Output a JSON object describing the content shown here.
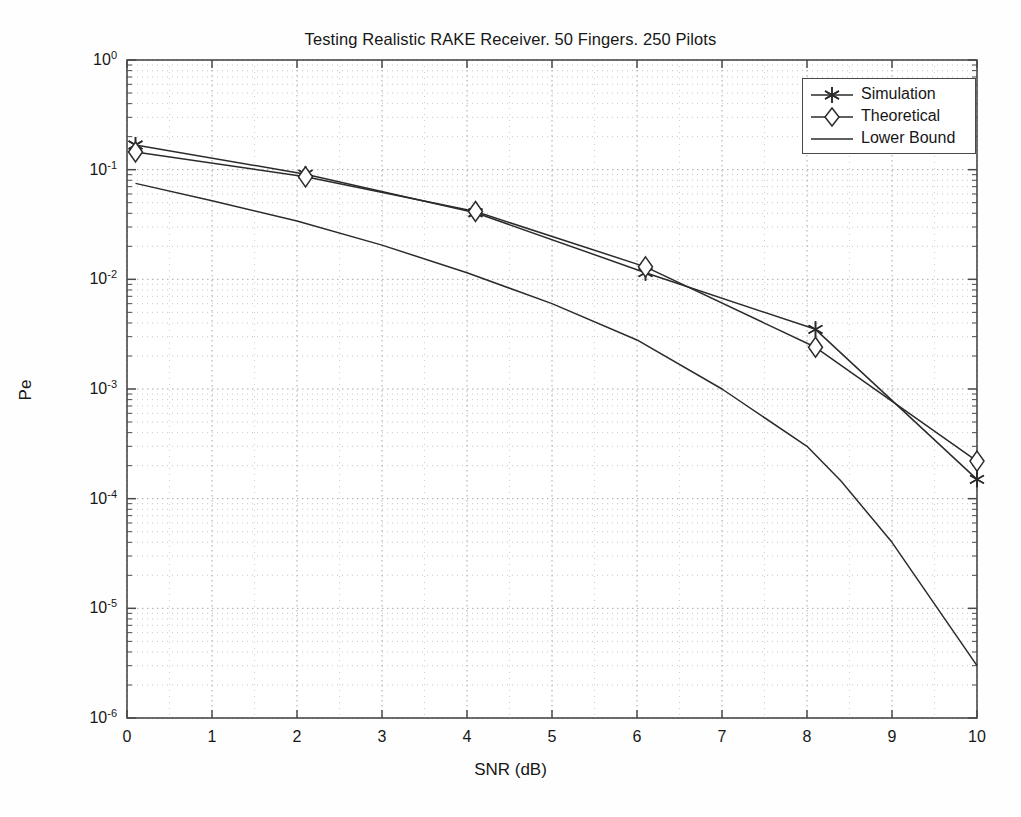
{
  "chart_data": {
    "type": "line",
    "title": "Testing Realistic RAKE Receiver. 50 Fingers. 250 Pilots",
    "xlabel": "SNR (dB)",
    "ylabel": "Pe",
    "yscale": "log",
    "xscale": "linear",
    "xlim": [
      0,
      10
    ],
    "ylim": [
      1e-06,
      1
    ],
    "grid": true,
    "grid_style": "dotted-minor-and-major",
    "legend_position": "upper-right",
    "xticks": [
      "0",
      "1",
      "2",
      "3",
      "4",
      "5",
      "6",
      "7",
      "8",
      "9",
      "10"
    ],
    "yticks": [
      "10^0",
      "10^-1",
      "10^-2",
      "10^-3",
      "10^-4",
      "10^-5",
      "10^-6"
    ],
    "ytick_mantissa": [
      "10",
      "10",
      "10",
      "10",
      "10",
      "10",
      "10"
    ],
    "ytick_exponent": [
      "0",
      "-1",
      "-2",
      "-3",
      "-4",
      "-5",
      "-6"
    ],
    "ytick_values": [
      1,
      0.1,
      0.01,
      0.001,
      0.0001,
      1e-05,
      1e-06
    ],
    "series": [
      {
        "name": "Simulation",
        "marker": "star-asterisk",
        "color": "#2b2b2b",
        "x": [
          0.1,
          2.1,
          4.1,
          6.1,
          8.1,
          10.0
        ],
        "y": [
          0.168,
          0.091,
          0.0405,
          0.0115,
          0.0035,
          0.00015
        ]
      },
      {
        "name": "Theoretical",
        "marker": "diamond",
        "color": "#2b2b2b",
        "x": [
          0.1,
          2.1,
          4.1,
          6.1,
          8.1,
          10.0
        ],
        "y": [
          0.145,
          0.086,
          0.0415,
          0.013,
          0.0024,
          0.00022
        ]
      },
      {
        "name": "Lower Bound",
        "marker": "none",
        "color": "#2b2b2b",
        "x": [
          0.1,
          1.0,
          2.0,
          3.0,
          4.0,
          5.0,
          6.0,
          7.0,
          8.0,
          8.4,
          9.0,
          10.0
        ],
        "y": [
          0.075,
          0.052,
          0.034,
          0.0205,
          0.0115,
          0.006,
          0.0028,
          0.001,
          0.0003,
          0.000145,
          4e-05,
          3e-06
        ]
      }
    ]
  },
  "legend": {
    "items": [
      {
        "label": "Simulation",
        "marker": "star-asterisk"
      },
      {
        "label": "Theoretical",
        "marker": "diamond"
      },
      {
        "label": "Lower Bound",
        "marker": "none"
      }
    ]
  },
  "colors": {
    "line": "#2b2b2b",
    "axis": "#4a4a4a",
    "grid": "#b9b9b9",
    "text": "#171717",
    "background": "#fefefe"
  }
}
